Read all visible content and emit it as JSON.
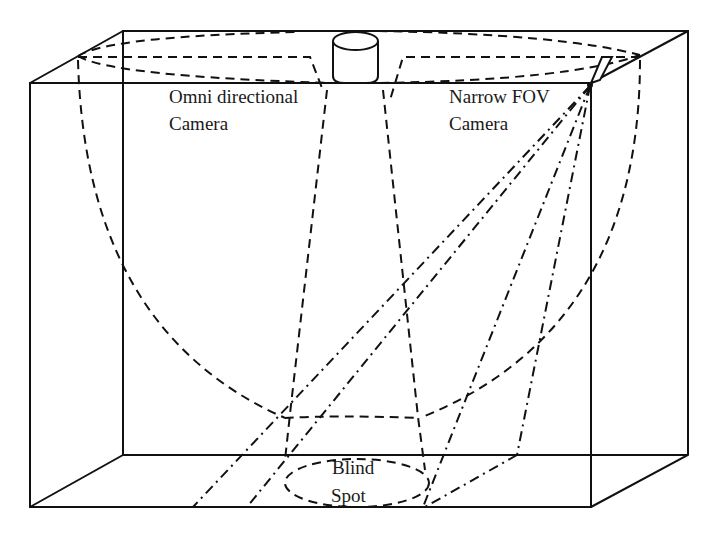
{
  "diagram": {
    "type": "room camera coverage schematic",
    "labels": {
      "omni_line1": "Omni directional",
      "omni_line2": "Camera",
      "narrow_line1": "Narrow FOV",
      "narrow_line2": "Camera",
      "blind_line1": "Blind",
      "blind_line2": "Spot"
    },
    "colors": {
      "line": "#111111",
      "background": "#ffffff"
    },
    "line_styles": {
      "room_edges": "solid",
      "omni_coverage": "dashed",
      "narrow_fov_coverage": "dash-dot"
    }
  }
}
